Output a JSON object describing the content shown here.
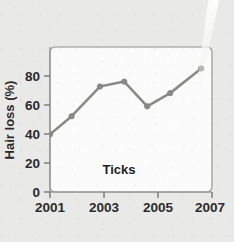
{
  "page": {
    "background_color": "#e9e9e7",
    "plot_background_color": "#fbfbfb"
  },
  "chart_data": {
    "type": "line",
    "title": "",
    "subtitle": "",
    "xlabel": "",
    "ylabel": "Hair loss (%)",
    "xlim": [
      2001,
      2007
    ],
    "ylim": [
      0,
      88
    ],
    "grid": false,
    "legend": false,
    "annotations": [
      {
        "text": "Ticks",
        "x": 2003.1,
        "y": 17
      }
    ],
    "x_ticks": [
      2001,
      2003,
      2005,
      2007
    ],
    "x_tick_labels": [
      "2001",
      "2003",
      "2005",
      "2007"
    ],
    "y_ticks": [
      0,
      20,
      40,
      60,
      80
    ],
    "y_tick_labels": [
      "0",
      "20",
      "40",
      "60",
      "80"
    ],
    "series": [
      {
        "name": "Hair loss",
        "color": "#8a8a87",
        "marker": "circle",
        "x": [
          2001.0,
          2001.8,
          2002.85,
          2003.75,
          2004.6,
          2005.45,
          2006.6
        ],
        "values": [
          35,
          46,
          64,
          67,
          52,
          60,
          75
        ]
      }
    ]
  },
  "artifacts": {
    "scan_streak": {
      "name": "diagonal-light-streak",
      "color": "#f4f4f2"
    }
  }
}
